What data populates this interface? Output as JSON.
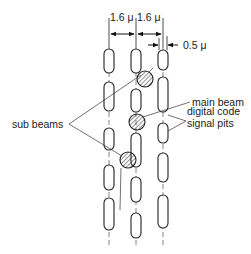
{
  "diagram": {
    "dimensions": {
      "track_pitch_1": "1.6 μ",
      "track_pitch_2": "1.6 μ",
      "pit_width": "0.5 μ"
    },
    "labels": {
      "main_beam": "main beam",
      "sub_beams": "sub beams",
      "pits_line1": "digital code",
      "pits_line2": "signal pits"
    },
    "colors": {
      "line": "#222222",
      "background": "#ffffff"
    }
  }
}
